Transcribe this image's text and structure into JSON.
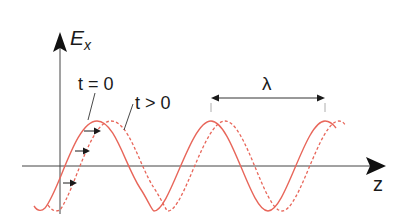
{
  "diagram": {
    "axes": {
      "vertical_label": "E",
      "vertical_subscript": "x",
      "horizontal_label": "z"
    },
    "labels": {
      "t_zero": "t = 0",
      "t_positive": "t > 0",
      "wavelength": "λ"
    },
    "colors": {
      "wave": "#e8665a",
      "axis": "#333333",
      "arrow": "#1a1a1a"
    },
    "waves": [
      {
        "name": "t = 0",
        "style": "solid",
        "first_crest_x": 97
      },
      {
        "name": "t > 0",
        "style": "dashed",
        "first_crest_x": 111
      }
    ],
    "wavelength_px": 114
  }
}
